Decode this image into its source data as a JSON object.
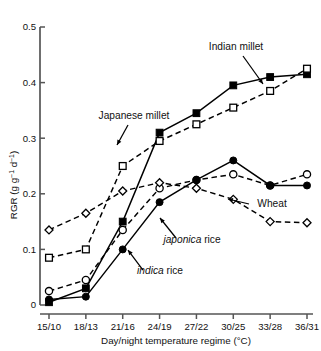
{
  "chart_data": {
    "type": "line",
    "title": "",
    "xlabel": "Day/night temperature regime (°C)",
    "ylabel": "RGR (g g⁻¹ d⁻¹)",
    "categories": [
      "15/10",
      "18/13",
      "21/16",
      "24/19",
      "27/22",
      "30/25",
      "33/28",
      "36/31"
    ],
    "ylim": [
      0,
      0.5
    ],
    "yticks": [
      "0",
      "0.1",
      "0.2",
      "0.3",
      "0.4",
      "0.5"
    ],
    "ytick_values": [
      0,
      0.1,
      0.2,
      0.3,
      0.4,
      0.5
    ],
    "grid": false,
    "legend": "inline-annotations",
    "series": [
      {
        "name": "Indian millet",
        "marker": "filled-square",
        "line": "solid",
        "values": [
          0.005,
          0.03,
          0.15,
          0.31,
          0.345,
          0.395,
          0.41,
          0.415
        ]
      },
      {
        "name": "Japanese millet",
        "marker": "open-square",
        "line": "dashed",
        "values": [
          0.085,
          0.1,
          0.25,
          0.295,
          0.325,
          0.355,
          0.385,
          0.425
        ]
      },
      {
        "name": "japonica rice",
        "marker": "open-circle",
        "line": "dashed",
        "values": [
          0.025,
          0.045,
          0.135,
          0.21,
          0.225,
          0.235,
          0.215,
          0.235
        ]
      },
      {
        "name": "indica rice",
        "marker": "filled-circle",
        "line": "solid",
        "values": [
          0.01,
          0.015,
          0.1,
          0.185,
          0.225,
          0.26,
          0.215,
          0.215
        ]
      },
      {
        "name": "Wheat",
        "marker": "open-diamond",
        "line": "dashed",
        "values": [
          0.135,
          0.165,
          0.205,
          0.22,
          0.21,
          0.19,
          0.15,
          0.148
        ]
      }
    ],
    "annotations": [
      {
        "text": "Indian millet",
        "italic_prefix": "",
        "x": 236,
        "y": 50,
        "anchor": "middle"
      },
      {
        "text": "Japanese millet",
        "italic_prefix": "",
        "x": 134,
        "y": 119,
        "anchor": "middle"
      },
      {
        "text": "Wheat",
        "italic_prefix": "",
        "x": 272,
        "y": 207,
        "anchor": "middle"
      },
      {
        "text": " rice",
        "italic_prefix": "japonica",
        "x": 192,
        "y": 243,
        "anchor": "middle"
      },
      {
        "text": " rice",
        "italic_prefix": "indica",
        "x": 160,
        "y": 274,
        "anchor": "middle"
      }
    ],
    "colors": {
      "line": "#000000",
      "axis": "#555555",
      "text": "#111111",
      "marker_fill": "#000000",
      "marker_open": "#ffffff"
    }
  }
}
